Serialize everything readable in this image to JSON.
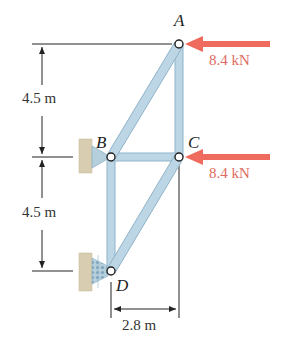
{
  "figure": {
    "type": "truss",
    "nodes": [
      {
        "id": "A",
        "label": "A"
      },
      {
        "id": "B",
        "label": "B"
      },
      {
        "id": "C",
        "label": "C"
      },
      {
        "id": "D",
        "label": "D"
      }
    ],
    "members": [
      "AB",
      "AC",
      "BC",
      "BD",
      "CD"
    ],
    "supports": [
      {
        "node": "B",
        "type": "pin",
        "label": "pin support at B"
      },
      {
        "node": "D",
        "type": "roller",
        "label": "roller support at D"
      }
    ],
    "loads": [
      {
        "node": "A",
        "value": "8.4 kN",
        "direction": "left"
      },
      {
        "node": "C",
        "value": "8.4 kN",
        "direction": "left"
      }
    ],
    "dimensions": {
      "upper_height": "4.5 m",
      "lower_height": "4.5 m",
      "width": "2.8 m"
    }
  },
  "colors": {
    "member_fill": "#bcd6e6",
    "member_edge": "#8fb3c9",
    "force_arrow": "#ef6b5e",
    "force_text": "#e06a60",
    "support_wall": "#d8cdb0",
    "dimension_line": "#222222"
  }
}
